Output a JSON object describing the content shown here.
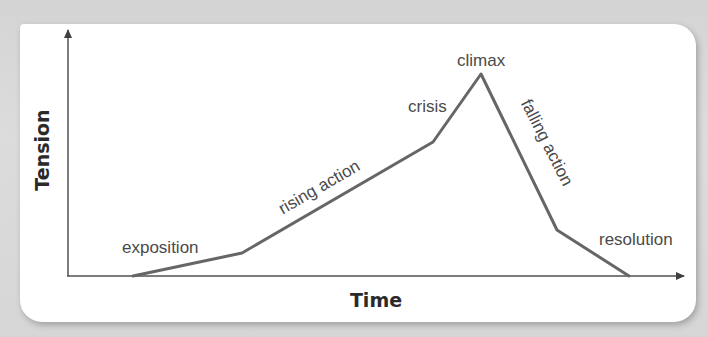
{
  "diagram": {
    "type": "plot-structure-line",
    "axes": {
      "x_label": "Time",
      "y_label": "Tension"
    },
    "stages": [
      {
        "label": "exposition"
      },
      {
        "label": "rising action"
      },
      {
        "label": "crisis"
      },
      {
        "label": "climax"
      },
      {
        "label": "falling action"
      },
      {
        "label": "resolution"
      }
    ],
    "points": [
      [
        133,
        276
      ],
      [
        242,
        253
      ],
      [
        433,
        142
      ],
      [
        481,
        74
      ],
      [
        557,
        230
      ],
      [
        629,
        276
      ]
    ],
    "colors": {
      "background": "#d8d8d8",
      "panel": "#ffffff",
      "axis": "#505050",
      "line": "#666666",
      "text": "#4a4a4a"
    }
  }
}
